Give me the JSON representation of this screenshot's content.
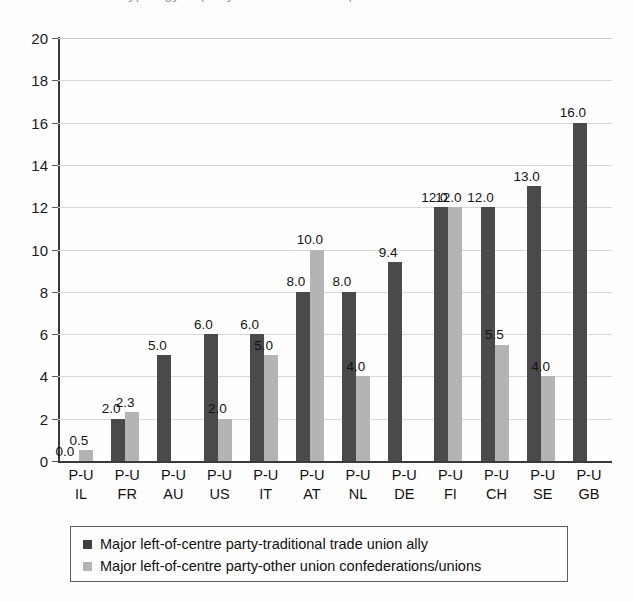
{
  "title_remnant": "Typology of party-union relationships",
  "chart_data": {
    "type": "bar",
    "title": "",
    "xlabel": "",
    "ylabel": "",
    "ylim": [
      0,
      20
    ],
    "ytick_step": 2,
    "yticks": [
      "0",
      "2",
      "4",
      "6",
      "8",
      "10",
      "12",
      "14",
      "16",
      "18",
      "20"
    ],
    "grid": true,
    "legend_position": "bottom",
    "categories": [
      "P-U IL",
      "P-U FR",
      "P-U AU",
      "P-U US",
      "P-U IT",
      "P-U AT",
      "P-U NL",
      "P-U DE",
      "P-U FI",
      "P-U CH",
      "P-U SE",
      "P-U GB"
    ],
    "category_lines": [
      {
        "line1": "P-U",
        "line2": "IL"
      },
      {
        "line1": "P-U",
        "line2": "FR"
      },
      {
        "line1": "P-U",
        "line2": "AU"
      },
      {
        "line1": "P-U",
        "line2": "US"
      },
      {
        "line1": "P-U",
        "line2": "IT"
      },
      {
        "line1": "P-U",
        "line2": "AT"
      },
      {
        "line1": "P-U",
        "line2": "NL"
      },
      {
        "line1": "P-U",
        "line2": "DE"
      },
      {
        "line1": "P-U",
        "line2": "FI"
      },
      {
        "line1": "P-U",
        "line2": "CH"
      },
      {
        "line1": "P-U",
        "line2": "SE"
      },
      {
        "line1": "P-U",
        "line2": "GB"
      }
    ],
    "series": [
      {
        "name": "Major left-of-centre party-traditional trade union ally",
        "color": "#4a4a4a",
        "values": [
          0.0,
          2.0,
          5.0,
          6.0,
          6.0,
          8.0,
          8.0,
          9.4,
          12.0,
          12.0,
          13.0,
          16.0
        ],
        "labels": [
          "0.0",
          "2.0",
          "5.0",
          "6.0",
          "6.0",
          "8.0",
          "8.0",
          "9.4",
          "12.0",
          "12.0",
          "13.0",
          "16.0"
        ]
      },
      {
        "name": "Major left-of-centre party-other union confederations/unions",
        "color": "#b4b4b4",
        "values": [
          0.5,
          2.3,
          null,
          2.0,
          5.0,
          10.0,
          4.0,
          null,
          12.0,
          5.5,
          4.0,
          null
        ],
        "labels": [
          "0.5",
          "2.3",
          "",
          "2.0",
          "5.0",
          "10.0",
          "4.0",
          "",
          "12.0",
          "5.5",
          "4.0",
          ""
        ]
      }
    ]
  },
  "legend": {
    "items": [
      {
        "label": "Major left-of-centre party-traditional trade union ally",
        "color": "#3f3f3f"
      },
      {
        "label": "Major left-of-centre party-other union confederations/unions",
        "color": "#b4b4b4"
      }
    ]
  }
}
